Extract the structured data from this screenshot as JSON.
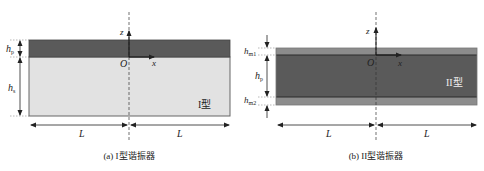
{
  "panel_a": {
    "caption": "(a) I型谐振器",
    "type_label": "I型",
    "labels": {
      "z": "z",
      "x": "x",
      "origin": "O",
      "hp_main": "h",
      "hp_sub": "p",
      "hs_main": "h",
      "hs_sub": "s",
      "L_left": "L",
      "L_right": "L"
    },
    "colors": {
      "piezo_layer": "#5a5a5a",
      "substrate_layer": "#e2e2e2",
      "outline": "#555555"
    }
  },
  "panel_b": {
    "caption": "(b) II型谐振器",
    "type_label": "II型",
    "labels": {
      "z": "z",
      "x": "x",
      "origin": "O",
      "hm1_main": "h",
      "hm1_sub": "m1",
      "hp_main": "h",
      "hp_sub": "p",
      "hm2_main": "h",
      "hm2_sub": "m2",
      "L_left": "L",
      "L_right": "L"
    },
    "colors": {
      "electrode_layer": "#8c8c8c",
      "piezo_layer": "#5a5a5a",
      "outline": "#333333"
    }
  }
}
